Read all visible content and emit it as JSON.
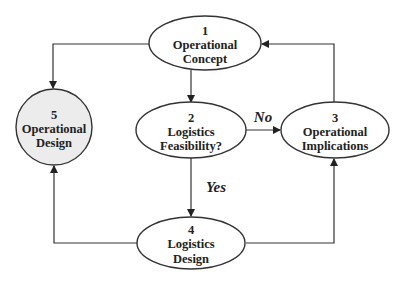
{
  "diagram": {
    "colors": {
      "default_fill": "#ffffff",
      "highlight_fill": "#ececec",
      "stroke": "#333333"
    },
    "nodes": [
      {
        "id": 1,
        "number": "1",
        "lines": [
          "Operational",
          "Concept"
        ],
        "highlighted": false
      },
      {
        "id": 2,
        "number": "2",
        "lines": [
          "Logistics",
          "Feasibility?"
        ],
        "highlighted": false
      },
      {
        "id": 3,
        "number": "3",
        "lines": [
          "Operational",
          "Implications"
        ],
        "highlighted": false
      },
      {
        "id": 4,
        "number": "4",
        "lines": [
          "Logistics",
          "Design"
        ],
        "highlighted": false
      },
      {
        "id": 5,
        "number": "5",
        "lines": [
          "Operational",
          "Design"
        ],
        "highlighted": true
      }
    ],
    "edges": [
      {
        "from": 1,
        "to": 2,
        "label": ""
      },
      {
        "from": 2,
        "to": 3,
        "label": "No"
      },
      {
        "from": 2,
        "to": 4,
        "label": "Yes"
      },
      {
        "from": 3,
        "to": 1,
        "label": ""
      },
      {
        "from": 4,
        "to": 3,
        "label": ""
      },
      {
        "from": 4,
        "to": 5,
        "label": ""
      },
      {
        "from": 1,
        "to": 5,
        "label": ""
      }
    ]
  }
}
